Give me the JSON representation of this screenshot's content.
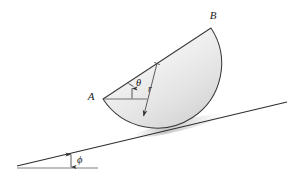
{
  "figure": {
    "background_color": "#ffffff",
    "labels": {
      "point_a": "A",
      "point_b": "B",
      "radius": "r",
      "angle_theta": "θ",
      "angle_phi": "ϕ"
    },
    "colors": {
      "outline": "#3a3a3a",
      "fill_light": "#f4f4f4",
      "fill_dark": "#d8d8d8",
      "incline_line": "#2e2e2e",
      "baseline": "#5a5a5a",
      "dimension_line": "#4a4a4a",
      "shadow": "#b8b8b8"
    },
    "geometry": {
      "point_a": {
        "x": 103,
        "y": 99
      },
      "point_b": {
        "x": 211,
        "y": 28
      },
      "arc_contact": {
        "x": 186,
        "y": 120
      },
      "radius_start": {
        "x": 157,
        "y": 63.5
      },
      "radius_end": {
        "x": 143,
        "y": 118
      },
      "incline_left": {
        "x": 17,
        "y": 166
      },
      "incline_right": {
        "x": 287,
        "y": 102
      },
      "baseline_left": {
        "x": 17,
        "y": 168
      },
      "baseline_right": {
        "x": 98,
        "y": 168
      },
      "theta_horizontal_end": {
        "x": 147,
        "y": 99
      },
      "phi_marker_x": 71
    },
    "annotations": {
      "theta_description": "angle between diameter AB and the horizontal at A",
      "phi_description": "inclination angle of the ramp relative to horizontal",
      "radius_description": "radius of the semicircular disk"
    }
  }
}
